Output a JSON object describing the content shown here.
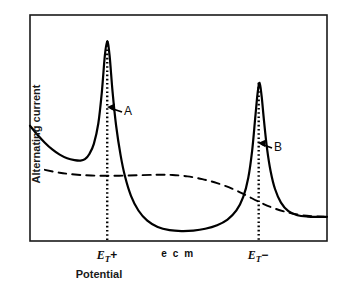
{
  "chart_data": {
    "type": "line",
    "title": "",
    "xlabel": "Potential",
    "ylabel": "Alternating current",
    "grid": false,
    "legend": null,
    "xlim": [
      0,
      100
    ],
    "ylim": [
      0,
      100
    ],
    "x_tick_labels": [
      "E_T+",
      "e c m",
      "E_T-"
    ],
    "x_tick_positions": [
      26,
      50,
      77
    ],
    "annotations": [
      {
        "label": "A",
        "x": 30,
        "y": 62,
        "arrow": "left",
        "target_x": 26
      },
      {
        "label": "B",
        "x": 80,
        "y": 41,
        "arrow": "left",
        "target_x": 77
      }
    ],
    "series": [
      {
        "name": "alternating current",
        "style": "solid",
        "color": "#000000",
        "points": [
          [
            0.0,
            51.0
          ],
          [
            2.5,
            47.0
          ],
          [
            5.0,
            43.5
          ],
          [
            7.5,
            40.5
          ],
          [
            10.0,
            38.2
          ],
          [
            12.5,
            36.6
          ],
          [
            15.0,
            35.8
          ],
          [
            17.0,
            35.6
          ],
          [
            18.5,
            36.2
          ],
          [
            20.0,
            38.5
          ],
          [
            21.5,
            43.0
          ],
          [
            23.0,
            52.0
          ],
          [
            24.2,
            66.0
          ],
          [
            25.2,
            82.0
          ],
          [
            26.0,
            88.5
          ],
          [
            26.8,
            82.0
          ],
          [
            27.8,
            66.0
          ],
          [
            29.0,
            51.0
          ],
          [
            30.5,
            38.0
          ],
          [
            32.0,
            28.5
          ],
          [
            34.0,
            20.0
          ],
          [
            36.5,
            13.5
          ],
          [
            39.5,
            9.0
          ],
          [
            43.0,
            6.2
          ],
          [
            47.0,
            4.8
          ],
          [
            51.0,
            4.4
          ],
          [
            55.0,
            4.6
          ],
          [
            59.0,
            5.4
          ],
          [
            63.0,
            7.0
          ],
          [
            66.5,
            9.5
          ],
          [
            69.5,
            13.5
          ],
          [
            71.8,
            19.5
          ],
          [
            73.5,
            28.0
          ],
          [
            74.8,
            40.0
          ],
          [
            75.8,
            54.0
          ],
          [
            76.6,
            65.0
          ],
          [
            77.3,
            70.0
          ],
          [
            78.0,
            64.0
          ],
          [
            78.8,
            53.0
          ],
          [
            79.8,
            41.0
          ],
          [
            81.0,
            31.0
          ],
          [
            82.5,
            23.0
          ],
          [
            84.5,
            17.0
          ],
          [
            87.0,
            13.2
          ],
          [
            90.0,
            11.4
          ],
          [
            93.5,
            10.8
          ],
          [
            97.0,
            10.7
          ],
          [
            100.0,
            10.7
          ]
        ]
      },
      {
        "name": "base current",
        "style": "dashed",
        "color": "#000000",
        "points": [
          [
            5.0,
            31.5
          ],
          [
            10.0,
            30.2
          ],
          [
            16.0,
            29.3
          ],
          [
            23.0,
            28.9
          ],
          [
            30.0,
            28.9
          ],
          [
            37.0,
            29.1
          ],
          [
            43.0,
            29.3
          ],
          [
            48.0,
            29.2
          ],
          [
            53.0,
            28.6
          ],
          [
            58.0,
            27.4
          ],
          [
            63.0,
            25.6
          ],
          [
            68.0,
            23.2
          ],
          [
            72.5,
            20.4
          ],
          [
            77.0,
            17.4
          ],
          [
            81.5,
            14.8
          ],
          [
            86.0,
            12.9
          ],
          [
            90.5,
            11.6
          ],
          [
            95.0,
            11.0
          ],
          [
            99.0,
            10.8
          ]
        ]
      }
    ],
    "vertical_markers": [
      {
        "label": "E_T+",
        "x": 26,
        "style": "dotted",
        "y_top": 88.5,
        "y_bottom": 0
      },
      {
        "label": "E_T-",
        "x": 77,
        "style": "dotted",
        "y_top": 70.0,
        "y_bottom": 0
      }
    ]
  },
  "axis": {
    "ylabel_text": "Alternating current",
    "xlabel_text": "Potential",
    "tick_ecm": "e c m",
    "tick_left_symbol": "E",
    "tick_left_sub": "T",
    "tick_left_sign": "+",
    "tick_right_symbol": "E",
    "tick_right_sub": "T",
    "tick_right_sign": "−"
  },
  "annotations": {
    "a_label": "A",
    "b_label": "B"
  },
  "colors": {
    "curve": "#000000",
    "frame": "#1a1a1a",
    "background": "#ffffff"
  }
}
